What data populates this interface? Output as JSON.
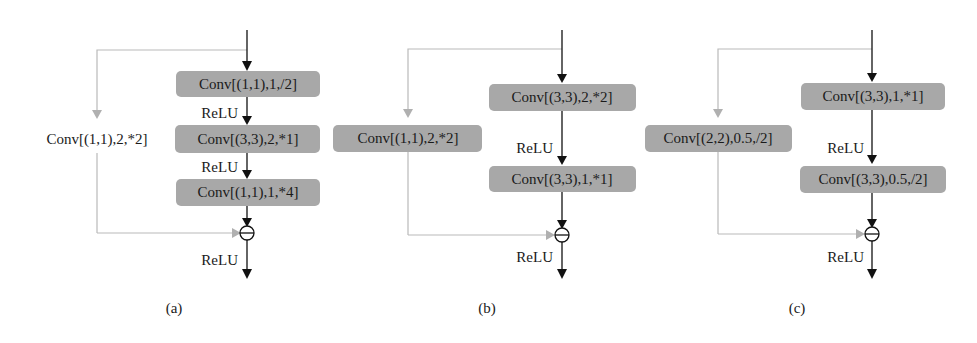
{
  "panels": [
    {
      "caption": "(a)",
      "shortcut_label": "Conv[(1,1),2,*2]",
      "shortcut_boxed": false,
      "main_blocks": [
        "Conv[(1,1),1,/2]",
        "Conv[(3,3),2,*1]",
        "Conv[(1,1),1,*4]"
      ],
      "activations": [
        "ReLU",
        "ReLU"
      ],
      "output_activation": "ReLU"
    },
    {
      "caption": "(b)",
      "shortcut_label": "Conv[(1,1),2,*2]",
      "shortcut_boxed": true,
      "main_blocks": [
        "Conv[(3,3),2,*2]",
        "Conv[(3,3),1,*1]"
      ],
      "activations": [
        "ReLU"
      ],
      "output_activation": "ReLU"
    },
    {
      "caption": "(c)",
      "shortcut_label": "Conv[(2,2),0.5,/2]",
      "shortcut_boxed": true,
      "main_blocks": [
        "Conv[(3,3),1,*1]",
        "Conv[(3,3),0.5,/2]"
      ],
      "activations": [
        "ReLU"
      ],
      "output_activation": "ReLU"
    }
  ],
  "sum_symbol": "⊕",
  "colors": {
    "block_fill": "#a8a8a8",
    "main_path": "#111111",
    "shortcut_path": "#b9b9b9"
  }
}
